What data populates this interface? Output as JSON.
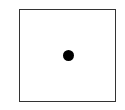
{
  "figure": {
    "shape": "square",
    "pip_count": 1,
    "pip_position": "center",
    "colors": {
      "border": "#333333",
      "fill": "#ffffff",
      "pip": "#000000"
    }
  }
}
